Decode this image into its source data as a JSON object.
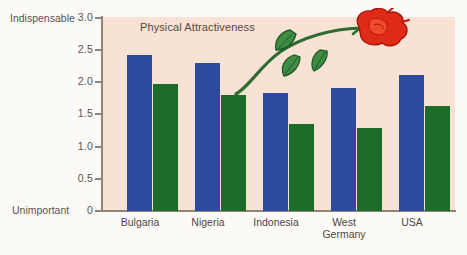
{
  "chart_data": {
    "type": "bar",
    "title": "Physical Attractiveness",
    "xlabel": "",
    "ylabel": "",
    "ylim": [
      0,
      3.0
    ],
    "grid": false,
    "legend": "none",
    "axis_endpoint_labels": {
      "top": "Indispensable",
      "bottom": "Unimportant"
    },
    "ytick_labels": [
      "3.0",
      "2.5",
      "2.0",
      "1.5",
      "1.0",
      "0.5",
      "0"
    ],
    "ytick_values": [
      3.0,
      2.5,
      2.0,
      1.5,
      1.0,
      0.5,
      0
    ],
    "categories": [
      "Bulgaria",
      "Nigeria",
      "Indonesia",
      "West\nGermany",
      "USA"
    ],
    "series": [
      {
        "name": "blue-series",
        "color": "#2c4a9e",
        "values": [
          2.42,
          2.29,
          1.83,
          1.9,
          2.11
        ]
      },
      {
        "name": "green-series",
        "color": "#1d6b28",
        "values": [
          1.97,
          1.79,
          1.35,
          1.28,
          1.63
        ]
      }
    ],
    "annotations": [
      "rose-illustration"
    ]
  },
  "colors": {
    "page_background": "#fbfaf7",
    "plot_background": "#f7e2d4",
    "axis": "#8d8578",
    "text": "#54493f",
    "blue_bar": "#2c4a9e",
    "green_bar": "#1d6b28",
    "rose_petal": "#e02b18",
    "rose_stem": "#2f6b32"
  },
  "icons": {
    "rose": "rose-icon"
  }
}
